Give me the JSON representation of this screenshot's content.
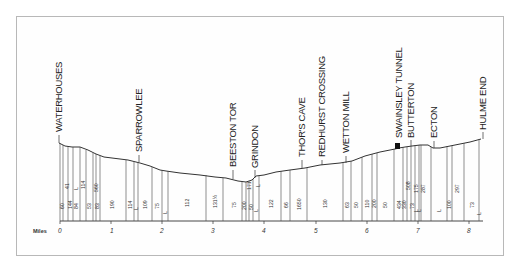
{
  "diagram": {
    "type": "railway gradient profile",
    "axis": {
      "label": "Miles",
      "ticks": [
        "0",
        "1",
        "2",
        "3",
        "4",
        "5",
        "6",
        "7",
        "8"
      ],
      "px_per_mile": 51.1,
      "origin_x": 60,
      "baseline_y": 221
    },
    "stations": [
      {
        "name": "WATERHOUSES",
        "mile": 0.0
      },
      {
        "name": "SPARROWLEE",
        "mile": 1.55
      },
      {
        "name": "BEESTON TOR",
        "mile": 3.45
      },
      {
        "name": "GRINDON",
        "mile": 3.85
      },
      {
        "name": "THOR'S CAVE",
        "mile": 4.75
      },
      {
        "name": "REDHURST CROSSING",
        "mile": 5.0
      },
      {
        "name": "WETTON MILL",
        "mile": 5.55
      },
      {
        "name": "SWAINSLEY TUNNEL",
        "mile": 6.55
      },
      {
        "name": "BUTTERTON",
        "mile": 6.8
      },
      {
        "name": "ECTON",
        "mile": 7.3
      },
      {
        "name": "HULME END",
        "mile": 8.3
      }
    ],
    "gradients_lower": [
      "60",
      "144",
      "84",
      "53",
      "83",
      "190",
      "114",
      "109",
      "75",
      "L",
      "112",
      "131½",
      "75",
      "200",
      "50",
      "L",
      "122",
      "66",
      "1650",
      "130",
      "63",
      "50",
      "110",
      "200",
      "50",
      "434",
      "330",
      "73",
      "L",
      "L",
      "100",
      "73",
      "L"
    ],
    "gradients_upper": [
      "41",
      "L",
      "114",
      "560",
      "L",
      "L",
      "L",
      "171",
      "508",
      "175",
      "287",
      "297"
    ]
  }
}
